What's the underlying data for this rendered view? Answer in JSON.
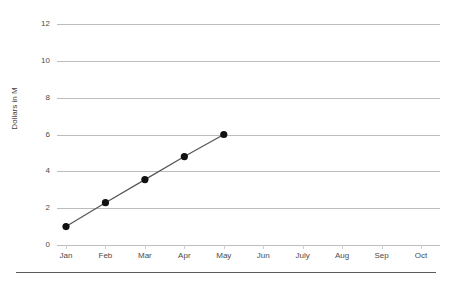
{
  "chart_data": {
    "type": "line",
    "title": "",
    "xlabel": "",
    "ylabel": "Dollars in M",
    "categories": [
      "Jan",
      "Feb",
      "Mar",
      "Apr",
      "May",
      "Jun",
      "July",
      "Aug",
      "Sep",
      "Oct"
    ],
    "series": [
      {
        "name": "Dollars in M",
        "values": [
          1.0,
          2.3,
          3.55,
          4.8,
          6.0,
          null,
          null,
          null,
          null,
          null
        ],
        "line_color": "#555555",
        "marker_color": "#111111"
      }
    ],
    "ylim": [
      0,
      12
    ],
    "yticks": [
      0,
      2,
      4,
      6,
      8,
      10,
      12
    ],
    "ytick_labels": [
      "0",
      "2",
      "4",
      "6",
      "8",
      "10",
      "12"
    ],
    "grid": "horizontal",
    "legend": "none",
    "background_color": "#ffffff",
    "gridline_color": "#bcbcbc",
    "axis_rule_color": "#5c5c5c"
  }
}
